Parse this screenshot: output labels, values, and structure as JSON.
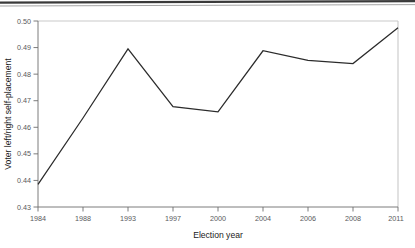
{
  "chart_data": {
    "type": "line",
    "title": "",
    "xlabel": "Election year",
    "ylabel": "Voter left/right self-placement",
    "categories": [
      "1984",
      "1988",
      "1993",
      "1997",
      "2000",
      "2004",
      "2006",
      "2008",
      "2011"
    ],
    "values": [
      0.4385,
      0.4635,
      0.4895,
      0.4678,
      0.4658,
      0.4888,
      0.4852,
      0.484,
      0.4975
    ],
    "series": [
      {
        "name": "Voter left/right self-placement",
        "values": [
          0.4385,
          0.4635,
          0.4895,
          0.4678,
          0.4658,
          0.4888,
          0.4852,
          0.484,
          0.4975
        ]
      }
    ],
    "ylim": [
      0.43,
      0.5
    ],
    "ytick_labels": [
      "0.43",
      "0.44",
      "0.45",
      "0.46",
      "0.47",
      "0.48",
      "0.49",
      "0.50"
    ],
    "ytick_values": [
      0.43,
      0.44,
      0.45,
      0.46,
      0.47,
      0.48,
      0.49,
      0.5
    ],
    "xtick_labels": [
      "1984",
      "1988",
      "1993",
      "1997",
      "2000",
      "2004",
      "2006",
      "2008",
      "2011"
    ],
    "grid": false,
    "legend": "none",
    "line_color": "#2b2b2b",
    "axis_color": "#b8b8b8",
    "text_color": "#58595b",
    "background": "#ffffff"
  },
  "axes": {
    "y_title": "Voter left/right self-placement",
    "x_title": "Election year"
  },
  "ticks": {
    "y": [
      "0.50",
      "0.49",
      "0.48",
      "0.47",
      "0.46",
      "0.45",
      "0.44",
      "0.43"
    ],
    "x": [
      "1984",
      "1988",
      "1993",
      "1997",
      "2000",
      "2004",
      "2006",
      "2008",
      "2011"
    ]
  }
}
